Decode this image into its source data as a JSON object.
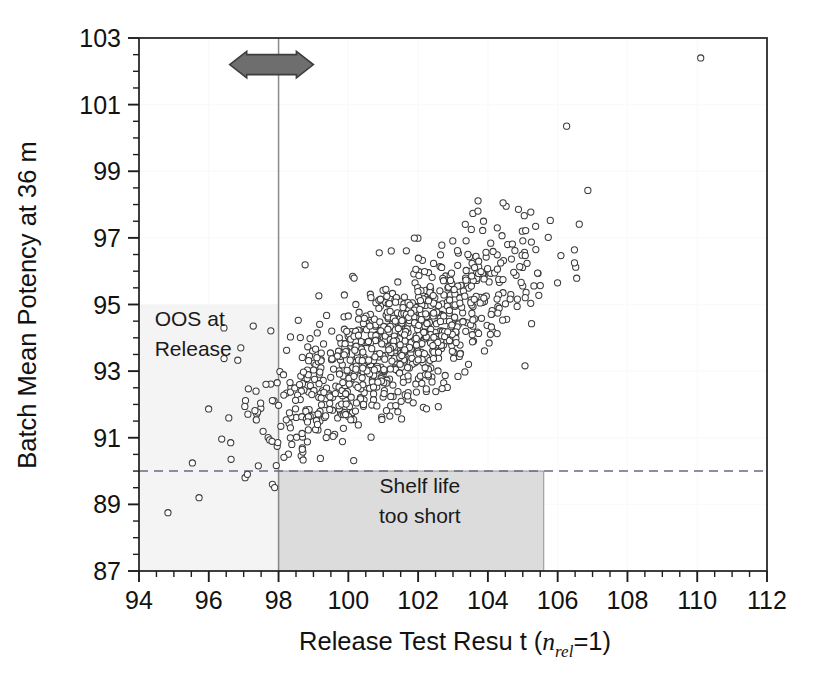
{
  "chart_data": {
    "type": "scatter",
    "title": "",
    "xlabel": "Release Test Resu t (n_rel=1)",
    "xlabel_parts": {
      "main": "Release Test Resu t  (",
      "italic_n": "n",
      "subscript": "rel",
      "tail": "=1)"
    },
    "ylabel": "Batch Mean Potency at 36 m",
    "xlim": [
      94,
      112
    ],
    "ylim": [
      87,
      103
    ],
    "x_major_ticks": [
      94,
      96,
      98,
      100,
      102,
      104,
      106,
      108,
      110,
      112
    ],
    "y_major_ticks": [
      87,
      89,
      91,
      93,
      95,
      97,
      99,
      101,
      103
    ],
    "x_minor_step": 0.5,
    "y_minor_step": 0.5,
    "x_tick_labels": [
      "94",
      "96",
      "98",
      "100",
      "102",
      "104",
      "106",
      "108",
      "110",
      "112"
    ],
    "y_tick_labels": [
      "87",
      "89",
      "91",
      "93",
      "95",
      "97",
      "99",
      "101",
      "103"
    ],
    "grid": "faint-internal",
    "legend": "none",
    "marker": {
      "shape": "open-circle",
      "radius_px": 3.1,
      "stroke": "#3a3a3a",
      "fill": "#ffffff",
      "stroke_width": 1.05
    },
    "n_points": 912,
    "correlation": 0.75,
    "x_mean": 101.5,
    "y_mean": 93.9,
    "x_sd": 1.85,
    "y_sd": 1.55,
    "reference_lines": [
      {
        "name": "release-spec-limit",
        "orientation": "vertical",
        "value": 98,
        "style": "solid",
        "color": "#8a8a8a"
      },
      {
        "name": "shelf-life-spec-limit",
        "orientation": "horizontal",
        "value": 90,
        "style": "dashed",
        "color": "#6a6a80"
      }
    ],
    "regions": [
      {
        "name": "oos-at-release",
        "label_lines": [
          "OOS at",
          "Release"
        ],
        "x_range": [
          94,
          98
        ],
        "y_range": [
          87,
          95
        ],
        "fill": "#f4f4f4",
        "border": "none",
        "label_x": 94.45,
        "label_y_top": 94.35
      },
      {
        "name": "shelf-life-too-short",
        "label_lines": [
          "Shelf life",
          "too short"
        ],
        "x_range": [
          98,
          105.6
        ],
        "y_range": [
          87,
          90
        ],
        "fill": "#dcdcdc",
        "border": "#9a9a9a",
        "label_x": 102.05,
        "label_y_top": 89.35
      }
    ],
    "annotations": [
      {
        "name": "spec-shift-arrow",
        "type": "double-headed-arrow",
        "centered_on_x": 98,
        "x_range": [
          96.6,
          99.0
        ],
        "y": 102.2,
        "fill": "#6e6e6e",
        "stroke": "#3d3d3d"
      }
    ],
    "outlier_points": [
      {
        "x": 110.1,
        "y": 102.4
      }
    ]
  },
  "figure": {
    "background": "#ffffff",
    "frame_color": "#2a2a2a",
    "axis_color": "#1e1e1e"
  }
}
